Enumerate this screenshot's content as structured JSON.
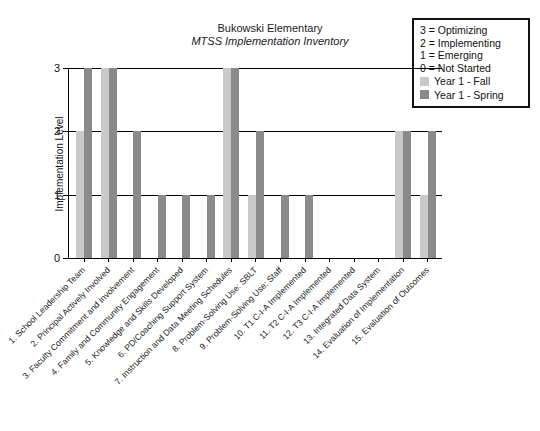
{
  "chart_data": {
    "type": "bar",
    "title": "Bukowski Elementary",
    "subtitle": "MTSS Implementation Inventory",
    "xlabel": "",
    "ylabel": "Implementation Level",
    "ylim": [
      0,
      3
    ],
    "yticks": [
      "0",
      "1",
      "2",
      "3"
    ],
    "grid": true,
    "legend_position": "top-right",
    "categories": [
      "1. School Leadership Team",
      "2. Principal Actively Involved",
      "3. Faculty Commitment and Involvement",
      "4. Family and Community Engagement",
      "5. Knowledge and Skills Developed",
      "6. PD/Coaching Support System",
      "7. Instruction and Data Meeting Schedules",
      "8. Problem-Solving Use: SBLT",
      "9. Problem-Solving Use: Staff",
      "10. T1 C-I-A Implemented",
      "11. T2 C-I-A Implemented",
      "12. T3 C-I-A Implemented",
      "13. Integrated Data System",
      "14. Evaluation of Implementation",
      "15. Evaluation of Outcomes"
    ],
    "series": [
      {
        "name": "Year 1 - Fall",
        "color": "#c9c9c9",
        "values": [
          2,
          3,
          0,
          0,
          0,
          0,
          3,
          1,
          0,
          0,
          0,
          0,
          0,
          2,
          1
        ]
      },
      {
        "name": "Year 1 - Spring",
        "color": "#8a8a8a",
        "values": [
          3,
          3,
          2,
          1,
          1,
          1,
          3,
          2,
          1,
          1,
          0,
          0,
          0,
          2,
          2
        ]
      }
    ],
    "scale_key": [
      "3 = Optimizing",
      "2 = Implementing",
      "1 = Emerging",
      "0 = Not Started"
    ]
  },
  "legend": {
    "scale_items": [
      "3 = Optimizing",
      "2 = Implementing",
      "1 = Emerging",
      "0 = Not Started"
    ],
    "series_items": [
      {
        "label": "Year 1 - Fall",
        "color": "#c9c9c9"
      },
      {
        "label": "Year 1 - Spring",
        "color": "#8a8a8a"
      }
    ]
  }
}
